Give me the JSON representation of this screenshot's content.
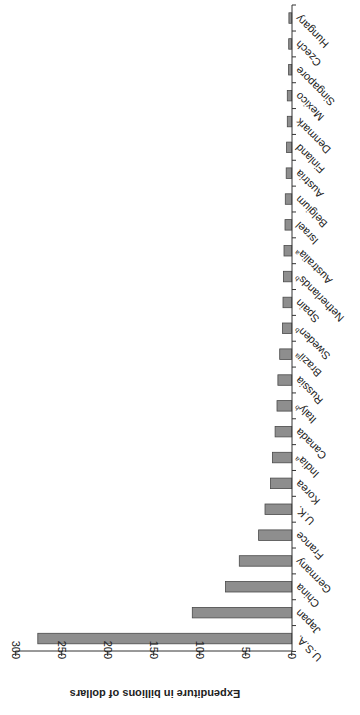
{
  "chart_data": {
    "type": "bar",
    "orientation": "rotated 90° clockwise (vertical bar chart printed sideways)",
    "title": "",
    "xlabel": "",
    "ylabel": "Expenditure in billions of dollars",
    "ylim": [
      0,
      300
    ],
    "yticks": [
      0,
      50,
      100,
      150,
      200,
      250,
      300
    ],
    "grid": false,
    "legend": null,
    "categories": [
      "U.S.A.",
      "Japan",
      "China",
      "Germany",
      "France",
      "U.K.",
      "Korea",
      "India",
      "Canada",
      "Italy",
      "Russia",
      "Brazil",
      "Sweden",
      "Spain",
      "Netherlands",
      "Australia",
      "Israel",
      "Belgium",
      "Austria",
      "Finland",
      "Denmark",
      "Mexico",
      "Singapore",
      "Czech",
      "Hungary"
    ],
    "category_superscripts": [
      "",
      "",
      "",
      "",
      "",
      "",
      "",
      "a",
      "",
      "b",
      "",
      "a",
      "b",
      "",
      "b",
      "a",
      "",
      "",
      "",
      "",
      "",
      "",
      "",
      "",
      ""
    ],
    "values": [
      276,
      108,
      72,
      57,
      36,
      29,
      23,
      21,
      18,
      16,
      15,
      13,
      10,
      9.5,
      9,
      8.4,
      7.3,
      7,
      6,
      5.5,
      4.8,
      4.8,
      3.4,
      3.3,
      3
    ]
  }
}
